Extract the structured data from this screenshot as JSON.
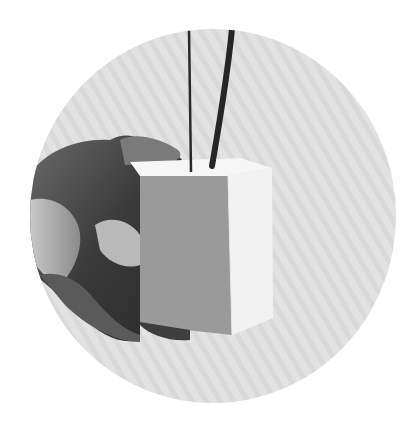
{
  "image": {
    "alt": "Black and white photo in a circular crop: a hand holding a white rectangular box with two black cables rising from its top",
    "shape": "circle",
    "colors": {
      "background": "#ffffff",
      "circle_fill": "#dedede",
      "box_front": "#9a9a9a",
      "box_side": "#f2f2f2",
      "box_top": "#f6f6f6",
      "hand": "#4a4a4a",
      "cable": "#222222"
    },
    "objects": [
      "hand",
      "white-box",
      "thin-cable",
      "thick-cable"
    ]
  }
}
